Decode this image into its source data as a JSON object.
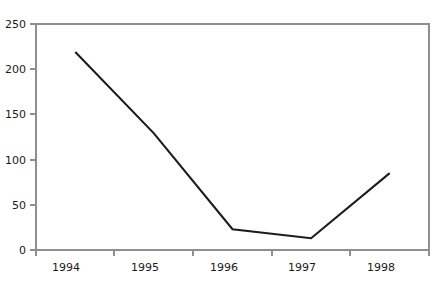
{
  "chart_data": {
    "type": "line",
    "title": "",
    "subtitle": "",
    "xlabel": "",
    "ylabel": "",
    "categories": [
      "1994",
      "1995",
      "1996",
      "1997",
      "1998"
    ],
    "series": [
      {
        "name": "series-1",
        "values": [
          219,
          129,
          23,
          13,
          85
        ],
        "color": "#1c1c1c"
      }
    ],
    "x": [
      "1994",
      "1995",
      "1996",
      "1997",
      "1998"
    ],
    "values": [
      219,
      129,
      23,
      13,
      85
    ],
    "ylim": [
      0,
      250
    ],
    "yticks": [
      0,
      50,
      100,
      150,
      200,
      250
    ],
    "ytick_labels": [
      "0",
      "50",
      "100",
      "150",
      "200",
      "250"
    ],
    "xtick_labels": [
      "1994",
      "1995",
      "1996",
      "1997",
      "1998"
    ],
    "grid": false,
    "legend": false,
    "legend_position": "none",
    "annotations": [],
    "frame_color": "#8f8f8f",
    "background_color": "#ffffff",
    "line_color": "#1c1c1c"
  },
  "axes": {
    "y": {
      "t250": "250",
      "t200": "200",
      "t150": "150",
      "t100": "100",
      "t50": "50",
      "t0": "0"
    },
    "x": {
      "t1994": "1994",
      "t1995": "1995",
      "t1996": "1996",
      "t1997": "1997",
      "t1998": "1998"
    }
  }
}
